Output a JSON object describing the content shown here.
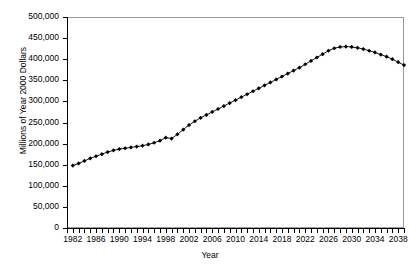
{
  "chart_data": {
    "type": "line",
    "title": "",
    "subtitle": "",
    "xlabel": "Year",
    "ylabel": "Millions of Year 2000 Dollars",
    "xlim": [
      1981,
      2039
    ],
    "ylim": [
      0,
      500000
    ],
    "grid": false,
    "legend": "none",
    "marker": "diamond",
    "line_color": "#000000",
    "marker_color": "#000000",
    "ytick_labels": [
      "0",
      "50,000",
      "100,000",
      "150,000",
      "200,000",
      "250,000",
      "300,000",
      "350,000",
      "400,000",
      "450,000",
      "500,000"
    ],
    "ytick_values": [
      0,
      50000,
      100000,
      150000,
      200000,
      250000,
      300000,
      350000,
      400000,
      450000,
      500000
    ],
    "xtick_labels": [
      "1982",
      "1986",
      "1990",
      "1994",
      "1998",
      "2002",
      "2006",
      "2010",
      "2014",
      "2018",
      "2022",
      "2026",
      "2030",
      "2034",
      "2038"
    ],
    "xtick_values": [
      1982,
      1986,
      1990,
      1994,
      1998,
      2002,
      2006,
      2010,
      2014,
      2018,
      2022,
      2026,
      2030,
      2034,
      2038
    ],
    "xtick_minor_step": 1,
    "series": [
      {
        "name": "Projected Value",
        "x": [
          1982,
          1983,
          1984,
          1985,
          1986,
          1987,
          1988,
          1989,
          1990,
          1991,
          1992,
          1993,
          1994,
          1995,
          1996,
          1997,
          1998,
          1999,
          2000,
          2001,
          2002,
          2003,
          2004,
          2005,
          2006,
          2007,
          2008,
          2009,
          2010,
          2011,
          2012,
          2013,
          2014,
          2015,
          2016,
          2017,
          2018,
          2019,
          2020,
          2021,
          2022,
          2023,
          2024,
          2025,
          2026,
          2027,
          2028,
          2029,
          2030,
          2031,
          2032,
          2033,
          2034,
          2035,
          2036,
          2037,
          2038,
          2039
        ],
        "values": [
          148000,
          153000,
          159000,
          165000,
          170000,
          175000,
          180000,
          184000,
          187000,
          189000,
          191000,
          193000,
          195000,
          198000,
          202000,
          207000,
          214000,
          212000,
          222000,
          233000,
          244000,
          253000,
          261000,
          268000,
          275000,
          282000,
          289000,
          296000,
          303000,
          310000,
          317000,
          324000,
          331000,
          338000,
          345000,
          352000,
          359000,
          366000,
          373000,
          380000,
          388000,
          396000,
          404000,
          412000,
          420000,
          426000,
          429000,
          430000,
          429000,
          427000,
          424000,
          420000,
          416000,
          411000,
          406000,
          400000,
          393000,
          386000
        ]
      }
    ]
  }
}
